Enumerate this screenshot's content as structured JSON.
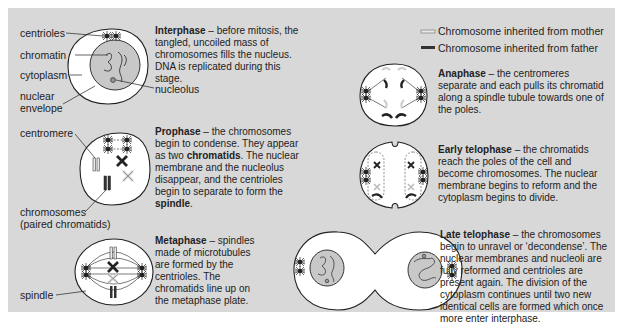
{
  "legend": {
    "mother": "Chromosome inherited from mother",
    "father": "Chromosome inherited from father",
    "mother_color": "#e8e8e8",
    "father_color": "#333333"
  },
  "labels": {
    "centrioles": "centrioles",
    "chromatin": "chromatin",
    "cytoplasm": "cytoplasm",
    "nuclear_envelope_1": "nuclear",
    "nuclear_envelope_2": "envelope",
    "nucleolus": "nucleolus",
    "centromere": "centromere",
    "chromosomes_1": "chromosomes",
    "chromosomes_2": "(paired chromatids)",
    "spindle": "spindle"
  },
  "stages": {
    "interphase": {
      "title": "Interphase",
      "text": " – before mitosis, the tangled, uncoiled mass of chromosomes fills the nucleus. DNA is replicated during this stage."
    },
    "prophase": {
      "title": "Prophase",
      "text_1": " – the chromosomes begin to condense. They appear as two ",
      "bold_1": "chromatids",
      "text_2": ". The nuclear membrane and the nucleolus disappear, and the centrioles begin to separate to form the ",
      "bold_2": "spindle",
      "text_3": "."
    },
    "metaphase": {
      "title": "Metaphase",
      "text": " – spindles made of microtubules are formed by the centrioles. The chromatids line up on the metaphase plate."
    },
    "anaphase": {
      "title": "Anaphase",
      "text": " – the centromeres separate and each pulls its chromatid along a spindle tubule towards one of the poles."
    },
    "early_telophase": {
      "title": "Early telophase",
      "text": " – the chromatids reach the poles of the cell and become chromosomes. The nuclear membrane begins to reform and the cytoplasm begins to divide."
    },
    "late_telophase": {
      "title": "Late telophase",
      "text": " – the chromosomes begin to unravel or ‘decondense’. The nuclear membranes and nucleoli are fully reformed and centrioles are present again. The division of the cytoplasm continues until two new identical cells are formed which once more enter interphase."
    }
  },
  "colors": {
    "panel_bg": "#d8d8d8",
    "cell_fill": "#ffffff",
    "nucleus_fill": "#c8c8c8",
    "outline": "#222222"
  }
}
